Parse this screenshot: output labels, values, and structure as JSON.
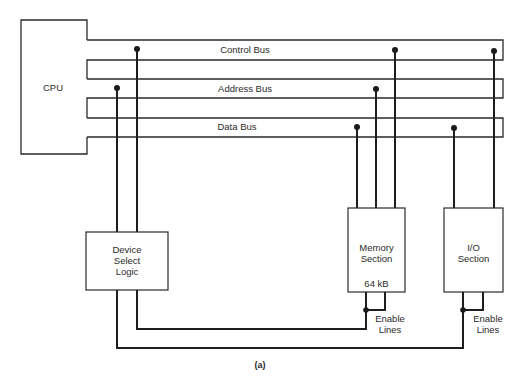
{
  "diagram": {
    "caption": "(a)",
    "blocks": {
      "cpu": "CPU",
      "device_select": [
        "Device",
        "Select",
        "Logic"
      ],
      "memory": [
        "Memory",
        "Section"
      ],
      "memory_size": "64 kB",
      "io": [
        "I/O",
        "Section"
      ]
    },
    "buses": {
      "control": "Control Bus",
      "address": "Address Bus",
      "data": "Data Bus"
    },
    "enable_labels": {
      "memory": [
        "Enable",
        "Lines"
      ],
      "io": [
        "Enable",
        "Lines"
      ]
    },
    "colors": {
      "line": "#2a2a2a",
      "background": "#ffffff"
    }
  }
}
